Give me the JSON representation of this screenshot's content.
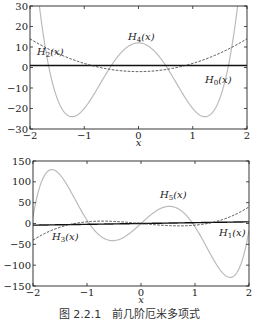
{
  "caption": "图 2.2.1　前几阶厄米多项式",
  "chart_data": [
    {
      "type": "line",
      "title": "",
      "xlabel": "x",
      "ylabel": "",
      "xlim": [
        -2,
        2
      ],
      "ylim": [
        -30,
        30
      ],
      "xticks": [
        -2,
        -1,
        0,
        1,
        2
      ],
      "xtick_labels": [
        "−2",
        "−1",
        "0",
        "1",
        "2"
      ],
      "yticks": [
        -30,
        -20,
        -10,
        0,
        10,
        20,
        30
      ],
      "ytick_labels": [
        "−30",
        "−20",
        "−10",
        "0",
        "10",
        "20",
        "30"
      ],
      "grid": false,
      "legend": "inline labels",
      "series": [
        {
          "name": "H0(x)",
          "label_text": "H0(x)",
          "formula": "1",
          "coeffs": [
            1
          ],
          "style": "solid",
          "color": "#111111",
          "width": 1.4,
          "label_pos": [
            205,
            83
          ]
        },
        {
          "name": "H2(x)",
          "label_text": "H2(x)",
          "formula": "4x^2-2",
          "coeffs": [
            -2,
            0,
            4
          ],
          "style": "dashed",
          "color": "#333333",
          "width": 0.9,
          "label_pos": [
            37,
            55
          ]
        },
        {
          "name": "H4(x)",
          "label_text": "H4(x)",
          "formula": "16x^4-48x^2+12",
          "coeffs": [
            12,
            0,
            -48,
            0,
            16
          ],
          "style": "solid",
          "color": "#bbbbbb",
          "width": 1.2,
          "label_pos": [
            128,
            40
          ]
        }
      ],
      "key_points": {
        "H4": [
          {
            "x": -2,
            "y": 28
          },
          {
            "x": -1.22,
            "y": -24
          },
          {
            "x": 0,
            "y": 12
          },
          {
            "x": 1.22,
            "y": -24
          },
          {
            "x": 2,
            "y": 28
          }
        ],
        "H2": [
          {
            "x": -2,
            "y": 14
          },
          {
            "x": 0,
            "y": -2
          },
          {
            "x": 2,
            "y": 14
          }
        ],
        "H0": [
          {
            "x": -2,
            "y": 1
          },
          {
            "x": 2,
            "y": 1
          }
        ]
      }
    },
    {
      "type": "line",
      "title": "",
      "xlabel": "x",
      "ylabel": "",
      "xlim": [
        -2,
        2
      ],
      "ylim": [
        -150,
        150
      ],
      "xticks": [
        -2,
        -1,
        0,
        1,
        2
      ],
      "xtick_labels": [
        "−2",
        "−1",
        "0",
        "1",
        "2"
      ],
      "yticks": [
        -150,
        -100,
        -50,
        0,
        50,
        100,
        150
      ],
      "ytick_labels": [
        "−150",
        "−100",
        "−50",
        "0",
        "50",
        "100",
        "150"
      ],
      "grid": false,
      "legend": "inline labels",
      "series": [
        {
          "name": "H1(x)",
          "label_text": "H1(x)",
          "formula": "2x",
          "coeffs": [
            0,
            2
          ],
          "style": "solid",
          "color": "#111111",
          "width": 1.4,
          "label_pos": [
            219,
            236
          ]
        },
        {
          "name": "H3(x)",
          "label_text": "H3(x)",
          "formula": "8x^3-12x",
          "coeffs": [
            0,
            -12,
            0,
            8
          ],
          "style": "dashed",
          "color": "#333333",
          "width": 0.9,
          "label_pos": [
            52,
            240
          ]
        },
        {
          "name": "H5(x)",
          "label_text": "H5(x)",
          "formula": "32x^5-160x^3+120x",
          "coeffs": [
            0,
            120,
            0,
            -160,
            0,
            32
          ],
          "style": "solid",
          "color": "#bbbbbb",
          "width": 1.2,
          "label_pos": [
            160,
            198
          ]
        }
      ],
      "key_points": {
        "H5": [
          {
            "x": -2,
            "y": -16
          },
          {
            "x": -1.66,
            "y": 128
          },
          {
            "x": -0.54,
            "y": -41
          },
          {
            "x": 0.54,
            "y": 41
          },
          {
            "x": 1.66,
            "y": -128
          },
          {
            "x": 2,
            "y": 16
          }
        ],
        "H3": [
          {
            "x": -2,
            "y": -40
          },
          {
            "x": -0.71,
            "y": 5.7
          },
          {
            "x": 0.71,
            "y": -5.7
          },
          {
            "x": 2,
            "y": 40
          }
        ],
        "H1": [
          {
            "x": -2,
            "y": -4
          },
          {
            "x": 2,
            "y": 4
          }
        ]
      }
    }
  ],
  "layout": {
    "plots": [
      {
        "left": 30,
        "top": 6,
        "right": 247,
        "bottom": 129,
        "xlabel_y": 146
      },
      {
        "left": 33,
        "top": 161,
        "right": 249,
        "bottom": 286,
        "xlabel_y": 303
      }
    ]
  }
}
